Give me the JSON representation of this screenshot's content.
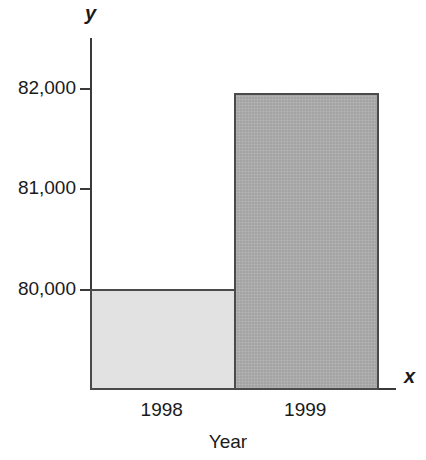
{
  "chart_data": {
    "type": "bar",
    "title": "",
    "subtitle": "",
    "categories": [
      "1998",
      "1999"
    ],
    "values": [
      80000,
      81950
    ],
    "series": [
      {
        "name": "",
        "values": [
          80000,
          81950
        ]
      }
    ],
    "xlabel": "Year",
    "ylabel": "",
    "x_axis_name": "x",
    "y_axis_name": "y",
    "ylim": [
      79000,
      82350
    ],
    "y_ticks": [
      82000,
      81000,
      80000
    ],
    "y_tick_labels": [
      "82,000",
      "81,000",
      "80,000"
    ],
    "grid": false,
    "legend": false,
    "legend_position": "none",
    "bar_colors": [
      "#e9e9e9",
      "#adadad"
    ],
    "bar_border_color": "#4a4a4a",
    "axis_color": "#3a3a3a",
    "background_color": "#ffffff"
  },
  "axis": {
    "y_name": "y",
    "x_name": "x",
    "y_tick_labels": {
      "t82000": "82,000",
      "t81000": "81,000",
      "t80000": "80,000"
    }
  },
  "categories": {
    "c0": "1998",
    "c1": "1999"
  },
  "titles": {
    "x_axis_title": "Year"
  }
}
